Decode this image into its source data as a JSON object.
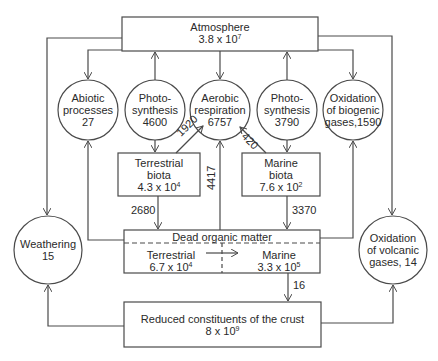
{
  "reservoirs": {
    "atmosphere": {
      "label": "Atmosphere",
      "value_base": "3.8 x 10",
      "exp": "7"
    },
    "terrestrial_biota": {
      "line1": "Terrestrial",
      "line2": "biota",
      "value_base": "4.3 x 10",
      "exp": "4"
    },
    "marine_biota": {
      "line1": "Marine",
      "line2": "biota",
      "value_base": "7.6 x 10",
      "exp": "2"
    },
    "dead_organic_matter": {
      "label": "Dead organic matter",
      "terrestrial": {
        "label": "Terrestrial",
        "value_base": "6.7 x 10",
        "exp": "4"
      },
      "marine": {
        "label": "Marine",
        "value_base": "3.3 x 10",
        "exp": "5"
      }
    },
    "crust": {
      "label": "Reduced constituents of the crust",
      "value_base": "8 x 10",
      "exp": "9"
    }
  },
  "processes": {
    "abiotic": {
      "line1": "Abiotic",
      "line2": "processes",
      "line3": "27"
    },
    "photosynthesis_terrestrial": {
      "line1": "Photo-",
      "line2": "synthesis",
      "line3": "4600"
    },
    "aerobic_respiration": {
      "line1": "Aerobic",
      "line2": "respiration",
      "line3": "6757"
    },
    "photosynthesis_marine": {
      "line1": "Photo-",
      "line2": "synthesis",
      "line3": "3790"
    },
    "oxidation_biogenic": {
      "line1": "Oxidation",
      "line2": "of biogenic",
      "line3": "gases,1590"
    },
    "weathering": {
      "line1": "Weathering",
      "line2": "15"
    },
    "oxidation_volcanic": {
      "line1": "Oxidation",
      "line2": "of volcanic",
      "line3": "gases, 14"
    }
  },
  "fluxes": {
    "terrestrial_to_respiration": "1920",
    "marine_to_respiration": "420",
    "dead_to_respiration": "4417",
    "terrestrial_to_dead": "2680",
    "marine_to_dead": "3370",
    "dead_to_crust": "16"
  },
  "colors": {
    "line": "#4a4a4a",
    "text": "#2a2a2a",
    "background": "#ffffff"
  }
}
